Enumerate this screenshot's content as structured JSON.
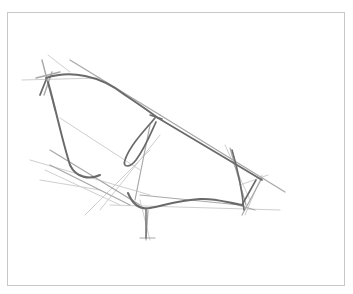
{
  "artwork": {
    "subject": "pencil sketch of a bicycle frame outline",
    "medium": "graphite on paper",
    "colors": {
      "paper": "#ffffff",
      "frame_border": "#c8c8c8",
      "stroke_dark": "#6a6a6a",
      "stroke_mid": "#a8a8a8",
      "stroke_light": "#cfcfcf"
    }
  }
}
